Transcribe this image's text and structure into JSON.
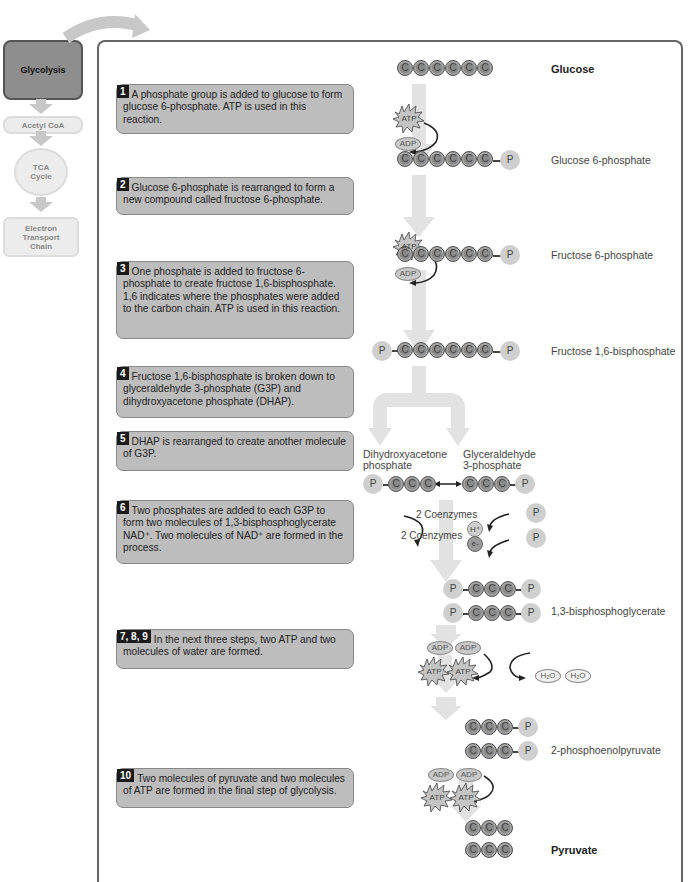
{
  "pathway": {
    "stages": [
      {
        "label": "Glycolysis",
        "active": true
      },
      {
        "label": "Acetyl CoA",
        "active": false
      },
      {
        "label": "TCA Cycle",
        "active": false
      },
      {
        "label": "Electron Transport Chain",
        "active": false
      }
    ]
  },
  "steps": [
    {
      "num": "1",
      "text": "A phosphate group is added to glucose to form glucose 6-phosphate. ATP is used in this reaction."
    },
    {
      "num": "2",
      "text": "Glucose 6-phosphate is rearranged to form a new compound called fructose 6-phosphate."
    },
    {
      "num": "3",
      "text": "One phosphate is added to fructose 6-phosphate to create fructose 1,6-bisphosphate. 1,6 indicates where the phosphates were added to the carbon chain. ATP is used in this reaction."
    },
    {
      "num": "4",
      "text": "Fructose 1,6-bisphosphate is broken down to glyceraldehyde 3-phosphate (G3P) and dihydroxyacetone phosphate (DHAP)."
    },
    {
      "num": "5",
      "text": "DHAP is rearranged to create another molecule of G3P."
    },
    {
      "num": "6",
      "text": "Two phosphates are added to each G3P to form two molecules of 1,3-bisphosphoglycerate NAD⁺. Two molecules of NAD⁺ are formed in the process."
    },
    {
      "num": "7, 8, 9",
      "text": "In the next three steps, two ATP and two molecules of water are formed."
    },
    {
      "num": "10",
      "text": "Two molecules of pyruvate and two molecules of ATP are formed in the final step of glycolysis."
    }
  ],
  "molecules": {
    "glucose": "Glucose",
    "g6p": "Glucose 6-phosphate",
    "f6p": "Fructose 6-phosphate",
    "f16bp": "Fructose 1,6-bisphosphate",
    "dhap": "Dihydroxyacetone phosphate",
    "g3p": "Glyceraldehyde 3-phosphate",
    "bpg": "1,3-bisphosphoglycerate",
    "pep": "2-phosphoenolpyruvate",
    "pyruvate": "Pyruvate"
  },
  "atoms": {
    "carbon": "C",
    "phosphate": "P",
    "hydrogen": "H⁺",
    "electron": "e-"
  },
  "cofactors": {
    "atp": "ATP",
    "adp": "ADP",
    "water": "H₂O",
    "coenzymes": "2 Coenzymes"
  },
  "colors": {
    "carbon": "#8a8a8a",
    "phosphate": "#cfcfcf",
    "step_box": "#bdbdbd",
    "arrow": "#e0e0e0",
    "panel_border": "#666666"
  }
}
